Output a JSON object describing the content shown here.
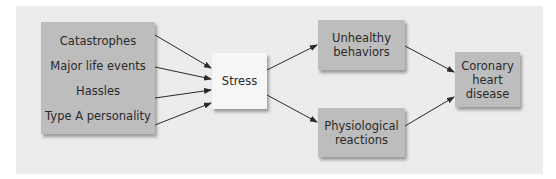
{
  "diagram": {
    "causes": [
      "Catastrophes",
      "Major life events",
      "Hassles",
      "Type A personality"
    ],
    "stress": "Stress",
    "pathways": {
      "behavioral": [
        "Unhealthy",
        "behaviors"
      ],
      "physiological": [
        "Physiological",
        "reactions"
      ]
    },
    "outcome": [
      "Coronary",
      "heart",
      "disease"
    ]
  },
  "colors": {
    "panel": "#ececec",
    "box": "#bdbdbd",
    "stress_box": "#f6f6f6",
    "arrow": "#2a2a2a"
  }
}
